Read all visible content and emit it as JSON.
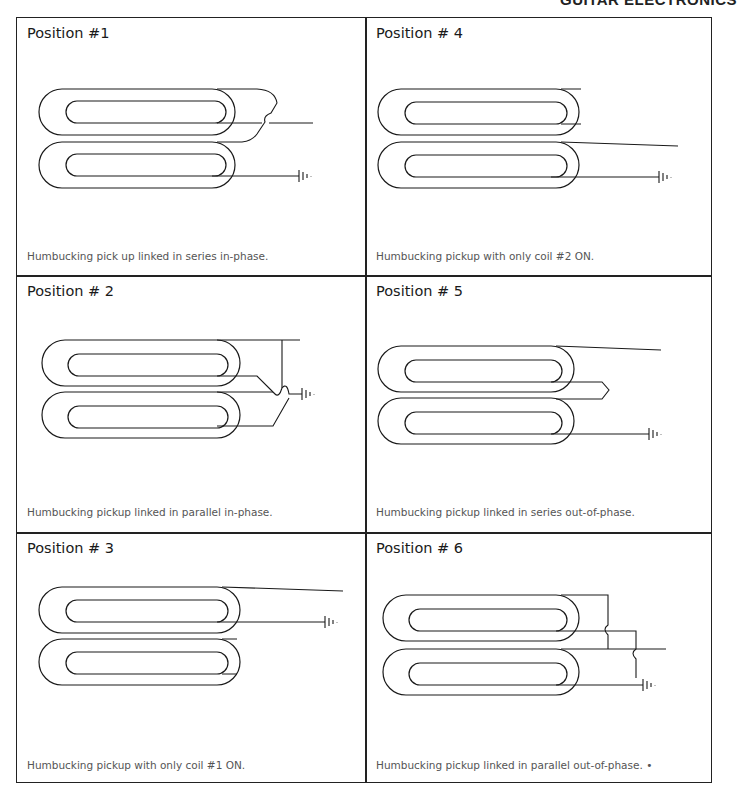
{
  "header": {
    "brand": "GUITAR ELECTRONICS"
  },
  "positions": [
    {
      "title": "Position #1",
      "caption": "Humbucking pick up linked in series in-phase.",
      "wiring": "series-in-phase",
      "coils_on": [
        1,
        2
      ]
    },
    {
      "title": "Position # 4",
      "caption": "Humbucking pickup with only coil #2 ON.",
      "wiring": "single-coil-2",
      "coils_on": [
        2
      ]
    },
    {
      "title": "Position # 2",
      "caption": "Humbucking pickup linked in parallel in-phase.",
      "wiring": "parallel-in-phase",
      "coils_on": [
        1,
        2
      ]
    },
    {
      "title": "Position # 5",
      "caption": "Humbucking pickup linked in series out-of-phase.",
      "wiring": "series-out-of-phase",
      "coils_on": [
        1,
        2
      ]
    },
    {
      "title": "Position # 3",
      "caption": "Humbucking pickup with only coil #1 ON.",
      "wiring": "single-coil-1",
      "coils_on": [
        1
      ]
    },
    {
      "title": "Position # 6",
      "caption": "Humbucking pickup linked in parallel out-of-phase.  •",
      "wiring": "parallel-out-of-phase",
      "coils_on": [
        1,
        2
      ]
    }
  ],
  "icons": {
    "ground": "ground-symbol-icon"
  }
}
